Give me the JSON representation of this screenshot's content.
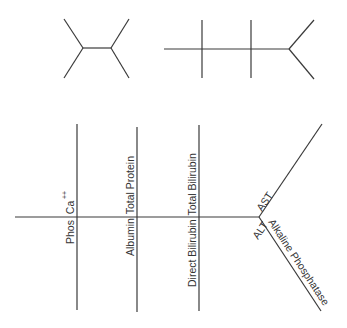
{
  "diagram": {
    "line_color": "#3a3a3a",
    "text_color": "#333333",
    "top_left_fishbone": {
      "type": "CBC fishbone",
      "labels": []
    },
    "top_right_fishbone": {
      "type": "BMP fishbone",
      "labels": []
    },
    "main_fishbone": {
      "labels": {
        "phos": "Phos",
        "ca": "Ca",
        "ca_superscript": "++",
        "albumin": "Albumin",
        "total_protein": "Total Protein",
        "direct_bilirubin": "Direct Bilirubin",
        "total_bilirubin": "Total Bilirubin",
        "ast": "AST",
        "alt": "ALT",
        "alkaline_phosphatase": "Alkaline Phosphatase"
      }
    }
  }
}
